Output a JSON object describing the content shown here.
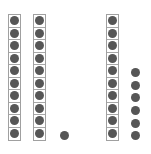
{
  "figure": {
    "dot_color": "#565656",
    "border_color": "#a0a0a0",
    "groups": [
      {
        "type": "ten-rod",
        "count": 10,
        "x": 8
      },
      {
        "type": "ten-rod",
        "count": 10,
        "x": 33
      },
      {
        "type": "ones",
        "count": 1,
        "x": 64,
        "y_centers": [
          135
        ]
      },
      {
        "type": "ten-rod",
        "count": 10,
        "x": 106
      },
      {
        "type": "ones",
        "count": 6,
        "x": 135,
        "y_centers": [
          72,
          85,
          97,
          110,
          123,
          135
        ]
      }
    ]
  }
}
